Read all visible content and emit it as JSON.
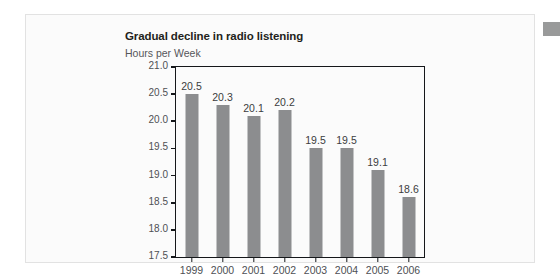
{
  "page": {
    "background_color": "#ffffff",
    "card_background_color": "#fbfbfb",
    "card_border_color": "#e2e2e2"
  },
  "artifact": {
    "name": "gray-block",
    "color": "#999a9a"
  },
  "chart_data": {
    "type": "bar",
    "title": "Gradual decline in radio listening",
    "subtitle": "Hours per Week",
    "xlabel": "",
    "ylabel": "Hours per Week",
    "categories": [
      "1999",
      "2000",
      "2001",
      "2002",
      "2003",
      "2004",
      "2005",
      "2006"
    ],
    "values": [
      20.5,
      20.3,
      20.1,
      20.2,
      19.5,
      19.5,
      19.1,
      18.6
    ],
    "value_labels": [
      "20.5",
      "20.3",
      "20.1",
      "20.2",
      "19.5",
      "19.5",
      "19.1",
      "18.6"
    ],
    "ylim": [
      17.5,
      21.0
    ],
    "ytick_step": 0.5,
    "ytick_labels": [
      "21.0",
      "20.5",
      "20.0",
      "19.5",
      "19.0",
      "18.5",
      "18.0",
      "17.5"
    ],
    "ytick_values": [
      21.0,
      20.5,
      20.0,
      19.5,
      19.0,
      18.5,
      18.0,
      17.5
    ],
    "grid": false,
    "legend": false,
    "legend_position": "none",
    "bar_color": "#8c8d8f",
    "axis_color": "#15171a",
    "label_color": "#4e5054",
    "title_color": "#231f20"
  }
}
